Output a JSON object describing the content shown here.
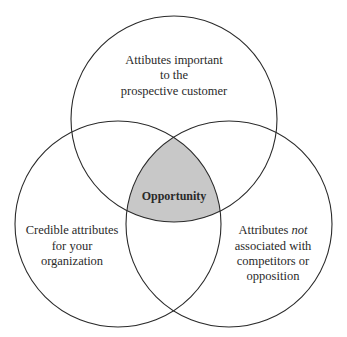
{
  "diagram": {
    "type": "venn",
    "circles": [
      {
        "id": "top",
        "label_lines": [
          "Attibutes important",
          "to the",
          "prospective customer"
        ]
      },
      {
        "id": "left",
        "label_lines": [
          "Credible attributes",
          "for your",
          "organization"
        ]
      },
      {
        "id": "right",
        "label_lines": [
          {
            "text": "Attributes ",
            "italic": "not"
          },
          "associated with",
          "competitors or",
          "opposition"
        ]
      }
    ],
    "intersection": {
      "label": "Opportunity",
      "fill": "#c8c8c8"
    },
    "colors": {
      "stroke": "#2a2a2a",
      "background": "#ffffff",
      "highlight": "#c8c8c8"
    }
  },
  "labels": {
    "top": {
      "l1": "Attibutes important",
      "l2": "to the",
      "l3": "prospective customer"
    },
    "left": {
      "l1": "Credible attributes",
      "l2": "for your",
      "l3": "organization"
    },
    "right": {
      "l1a": "Attributes ",
      "l1b": "not",
      "l2": "associated with",
      "l3": "competitors or",
      "l4": "opposition"
    },
    "center": "Opportunity"
  }
}
